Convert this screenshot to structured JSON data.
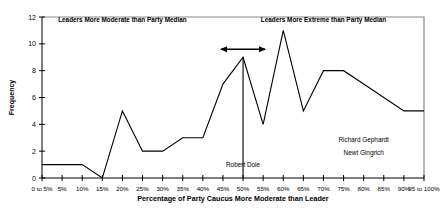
{
  "chart_data": {
    "type": "line",
    "title": "",
    "xlabel": "Percentage of Party Caucus More Moderate than Leader",
    "ylabel": "Frequency",
    "ylim": [
      0,
      12
    ],
    "yticks": [
      0,
      2,
      4,
      6,
      8,
      10,
      12
    ],
    "grid": false,
    "legend": "none",
    "categories": [
      "0 to 5%",
      "5%",
      "10%",
      "15%",
      "20%",
      "25%",
      "30%",
      "35%",
      "40%",
      "45%",
      "50%",
      "55%",
      "60%",
      "65%",
      "70%",
      "75%",
      "80%",
      "85%",
      "90%",
      "95 to 100%"
    ],
    "values": [
      1,
      1,
      1,
      0,
      5,
      2,
      2,
      3,
      3,
      7,
      9,
      4,
      11,
      5,
      8,
      8,
      7,
      6,
      5,
      5
    ],
    "series": [
      {
        "name": "Frequency",
        "values": [
          1,
          1,
          1,
          0,
          5,
          2,
          2,
          3,
          3,
          7,
          9,
          4,
          11,
          5,
          8,
          8,
          7,
          6,
          5,
          5
        ]
      }
    ],
    "annotations": [
      {
        "id": "left-header",
        "text": "Leaders More Moderate than Party Median",
        "x": "20%",
        "y": 11.6
      },
      {
        "id": "right-header",
        "text": "Leaders More Extreme than Party Median",
        "x": "70%",
        "y": 11.6
      },
      {
        "id": "dole",
        "text": "Robert Dole",
        "x": "50%",
        "y": 0.8
      },
      {
        "id": "gephardt",
        "text": "Richard Gephardt",
        "x": "80%",
        "y": 2.7
      },
      {
        "id": "gingrich",
        "text": "Newt Gingrich",
        "x": "80%",
        "y": 1.7
      }
    ],
    "markers": [
      {
        "id": "dole-reference-line",
        "type": "vline",
        "x": "50%",
        "y_top": 9,
        "y_bottom": 0
      },
      {
        "id": "peak-spread-arrow",
        "type": "double-arrow",
        "x": "50%",
        "y": 9.6
      }
    ],
    "colors": {
      "line": "#000000",
      "axis": "#000000",
      "frame": "#888888",
      "background": "#ffffff"
    }
  }
}
